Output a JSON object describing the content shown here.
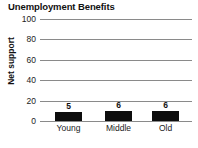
{
  "chart_data": {
    "type": "bar",
    "title": "Unemployment Benefits",
    "xlabel": "",
    "ylabel": "Net support",
    "categories": [
      "Young",
      "Middle",
      "Old"
    ],
    "values": [
      5,
      6,
      6
    ],
    "value_labels": [
      "5",
      "6",
      "6"
    ],
    "ylim": [
      0,
      100
    ],
    "yticks": [
      0,
      20,
      40,
      60,
      80,
      100
    ],
    "ytick_labels": [
      "0",
      "20",
      "40",
      "60",
      "80",
      "100"
    ],
    "grid": true,
    "legend": false,
    "colors": {
      "bar": "#0d0d0d",
      "grid": "#8a8a8a",
      "text": "#111111",
      "background": "#ffffff"
    }
  }
}
